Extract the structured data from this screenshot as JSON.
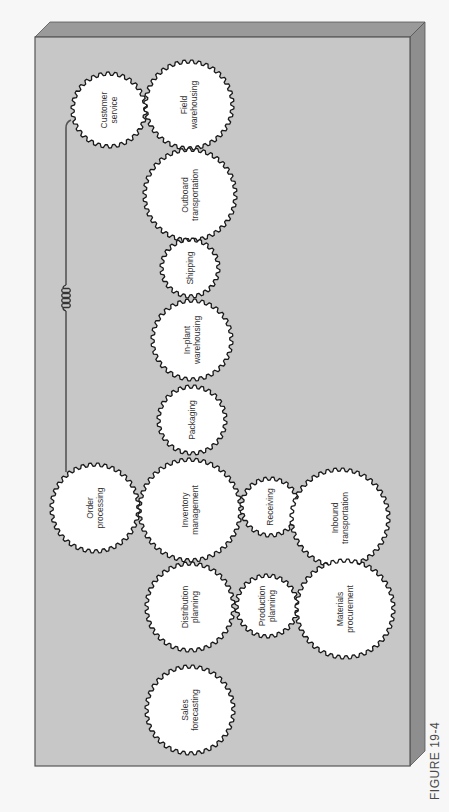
{
  "figure": {
    "caption": "FIGURE 19-4",
    "colors": {
      "background": "#f7f7f7",
      "board_face": "#c7c7c7",
      "board_top_bevel": "#9a9a9a",
      "board_side_bevel": "#8e8e8e",
      "board_edge": "#555555",
      "gear_fill": "#ffffff",
      "gear_stroke": "#1a1a1a",
      "connector": "#555555"
    }
  },
  "board": {
    "left": 35,
    "top": 37,
    "right": 410,
    "bottom": 766,
    "depth": 15
  },
  "gears": [
    {
      "id": "customer-service",
      "lines": [
        "Customer",
        "service"
      ],
      "cx": 109,
      "cy": 110,
      "r": 38,
      "teeth": 30
    },
    {
      "id": "field-warehousing",
      "lines": [
        "Field",
        "warehousing"
      ],
      "cx": 189,
      "cy": 105,
      "r": 45,
      "teeth": 36
    },
    {
      "id": "outboard-transportation",
      "lines": [
        "Outboard",
        "transportation"
      ],
      "cx": 190,
      "cy": 195,
      "r": 47,
      "teeth": 38
    },
    {
      "id": "shipping",
      "lines": [
        "Shipping"
      ],
      "cx": 190,
      "cy": 268,
      "r": 30,
      "teeth": 24
    },
    {
      "id": "in-plant-warehousing",
      "lines": [
        "In-plant",
        "warehousing"
      ],
      "cx": 192,
      "cy": 340,
      "r": 41,
      "teeth": 32
    },
    {
      "id": "packaging",
      "lines": [
        "Packaging"
      ],
      "cx": 192,
      "cy": 420,
      "r": 35,
      "teeth": 28
    },
    {
      "id": "order-processing",
      "lines": [
        "Order",
        "processing"
      ],
      "cx": 95,
      "cy": 508,
      "r": 45,
      "teeth": 36
    },
    {
      "id": "inventory-management",
      "lines": [
        "Inventory",
        "management"
      ],
      "cx": 190,
      "cy": 510,
      "r": 52,
      "teeth": 42
    },
    {
      "id": "receiving",
      "lines": [
        "Receiving"
      ],
      "cx": 270,
      "cy": 507,
      "r": 30,
      "teeth": 24
    },
    {
      "id": "inbound-transportation",
      "lines": [
        "Inbound",
        "transportation"
      ],
      "cx": 340,
      "cy": 518,
      "r": 50,
      "teeth": 40
    },
    {
      "id": "distribution-planning",
      "lines": [
        "Distribution",
        "planning"
      ],
      "cx": 190,
      "cy": 607,
      "r": 45,
      "teeth": 36
    },
    {
      "id": "production-planning",
      "lines": [
        "Production",
        "planning"
      ],
      "cx": 267,
      "cy": 606,
      "r": 32,
      "teeth": 26
    },
    {
      "id": "materials-procurement",
      "lines": [
        "Materials",
        "procurement"
      ],
      "cx": 345,
      "cy": 609,
      "r": 50,
      "teeth": 40
    },
    {
      "id": "sales-forecasting",
      "lines": [
        "Sales",
        "forecasting"
      ],
      "cx": 190,
      "cy": 710,
      "r": 45,
      "teeth": 36
    }
  ],
  "connector": {
    "from": "order-processing",
    "to": "customer-service",
    "x": 66,
    "y_top": 128,
    "y_bottom": 472,
    "spring_center_y": 298,
    "spring_coils": 4
  }
}
